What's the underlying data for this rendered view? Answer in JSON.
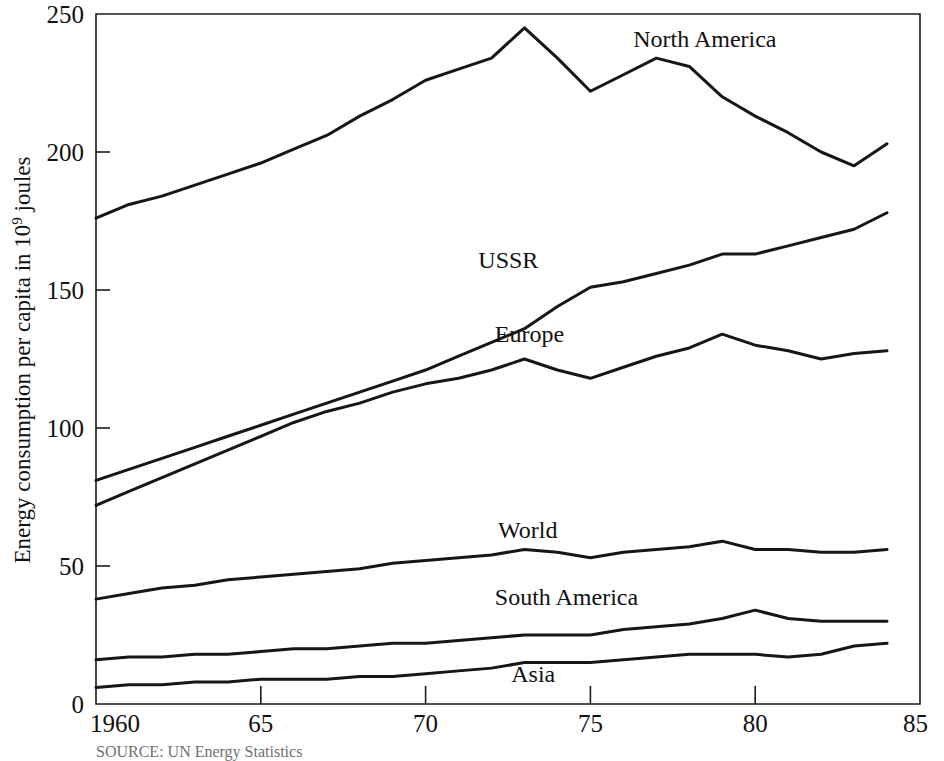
{
  "chart_data": {
    "type": "line",
    "title": "",
    "subtitle": "",
    "xlabel": "",
    "ylabel": "Energy consumption per capita in 10⁹ joules",
    "ylabel_parts": {
      "before": "Energy consumption per capita in 10",
      "superscript": "9",
      "after": " joules"
    },
    "xlim": [
      1960,
      1985
    ],
    "ylim": [
      0,
      250
    ],
    "xticks": [
      1960,
      1965,
      1970,
      1975,
      1980,
      1985
    ],
    "xtick_labels": [
      "1960",
      "65",
      "70",
      "75",
      "80",
      "85"
    ],
    "yticks": [
      0,
      50,
      100,
      150,
      200,
      250
    ],
    "ytick_labels": [
      "0",
      "50",
      "100",
      "150",
      "200",
      "250"
    ],
    "grid": false,
    "legend_position": "inline-labels",
    "line_color": "#161616",
    "x": [
      1960,
      1961,
      1962,
      1963,
      1964,
      1965,
      1966,
      1967,
      1968,
      1969,
      1970,
      1971,
      1972,
      1973,
      1974,
      1975,
      1976,
      1977,
      1978,
      1979,
      1980,
      1981,
      1982,
      1983,
      1984
    ],
    "series": [
      {
        "name": "North America",
        "label": "North America",
        "label_x": 1976.3,
        "label_y": 238,
        "values": [
          176,
          181,
          184,
          188,
          192,
          196,
          201,
          206,
          213,
          219,
          226,
          230,
          234,
          245,
          234,
          222,
          228,
          234,
          231,
          220,
          213,
          207,
          200,
          195,
          203
        ]
      },
      {
        "name": "USSR",
        "label": "USSR",
        "label_x": 1971.6,
        "label_y": 158,
        "values": [
          81,
          85,
          89,
          93,
          97,
          101,
          105,
          109,
          113,
          117,
          121,
          126,
          131,
          136,
          144,
          151,
          153,
          156,
          159,
          163,
          163,
          166,
          169,
          172,
          178
        ]
      },
      {
        "name": "Europe",
        "label": "Europe",
        "label_x": 1972.1,
        "label_y": 131,
        "values": [
          72,
          77,
          82,
          87,
          92,
          97,
          102,
          106,
          109,
          113,
          116,
          118,
          121,
          125,
          121,
          118,
          122,
          126,
          129,
          134,
          130,
          128,
          125,
          127,
          128
        ]
      },
      {
        "name": "World",
        "label": "World",
        "label_x": 1972.2,
        "label_y": 60,
        "values": [
          38,
          40,
          42,
          43,
          45,
          46,
          47,
          48,
          49,
          51,
          52,
          53,
          54,
          56,
          55,
          53,
          55,
          56,
          57,
          59,
          56,
          56,
          55,
          55,
          56
        ]
      },
      {
        "name": "South America",
        "label": "South America",
        "label_x": 1972.1,
        "label_y": 36,
        "values": [
          16,
          17,
          17,
          18,
          18,
          19,
          20,
          20,
          21,
          22,
          22,
          23,
          24,
          25,
          25,
          25,
          27,
          28,
          29,
          31,
          34,
          31,
          30,
          30,
          30
        ]
      },
      {
        "name": "Asia",
        "label": "Asia",
        "label_x": 1972.6,
        "label_y": 8,
        "values": [
          6,
          7,
          7,
          8,
          8,
          9,
          9,
          9,
          10,
          10,
          11,
          12,
          13,
          15,
          15,
          15,
          16,
          17,
          18,
          18,
          18,
          17,
          18,
          21,
          22
        ]
      }
    ],
    "source_note": "SOURCE: UN Energy Statistics"
  }
}
